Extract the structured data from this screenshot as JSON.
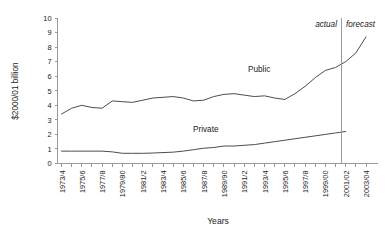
{
  "chart_data": {
    "type": "line",
    "title": "",
    "xlabel": "Years",
    "ylabel": "$2000/01 billion",
    "ylim": [
      0,
      10
    ],
    "ytick_labels": [
      "0",
      "1",
      "2",
      "3",
      "4",
      "5",
      "6",
      "7",
      "8",
      "9",
      "10"
    ],
    "grid": false,
    "legend": "inline-labels",
    "x": [
      "1973/4",
      "1974/5",
      "1975/6",
      "1976/7",
      "1977/8",
      "1978/9",
      "1979/80",
      "1980/1",
      "1981/2",
      "1982/3",
      "1983/4",
      "1984/5",
      "1985/6",
      "1986/7",
      "1987/8",
      "1988/9",
      "1989/90",
      "1990/1",
      "1991/2",
      "1992/3",
      "1993/4",
      "1994/5",
      "1995/6",
      "1996/7",
      "1997/8",
      "1998/9",
      "1999/00",
      "2000/01",
      "2001/02",
      "2002/03",
      "2003/04"
    ],
    "xtick_labels_shown": [
      "1973/4",
      "1975/6",
      "1977/8",
      "1979/80",
      "1981/2",
      "1983/4",
      "1985/6",
      "1987/8",
      "1988/90",
      "1991/2",
      "1993/4",
      "1995/6",
      "1997/8",
      "1999/00",
      "2001/02",
      "2003/04"
    ],
    "series": [
      {
        "name": "Public",
        "values": [
          3.4,
          3.8,
          4.0,
          3.85,
          3.8,
          4.3,
          4.25,
          4.2,
          4.35,
          4.5,
          4.55,
          4.6,
          4.5,
          4.3,
          4.35,
          4.6,
          4.75,
          4.8,
          4.7,
          4.6,
          4.65,
          4.5,
          4.4,
          4.8,
          5.3,
          5.9,
          6.4,
          6.6,
          7.0,
          7.6,
          8.7
        ],
        "label_text": "Public"
      },
      {
        "name": "Private",
        "values": [
          0.85,
          0.85,
          0.85,
          0.85,
          0.85,
          0.8,
          0.7,
          0.7,
          0.7,
          0.72,
          0.75,
          0.78,
          0.85,
          0.95,
          1.05,
          1.1,
          1.2,
          1.2,
          1.25,
          1.3,
          1.4,
          1.5,
          1.6,
          1.7,
          1.8,
          1.9,
          2.0,
          2.1,
          2.2,
          null,
          null
        ],
        "label_text": "Private"
      }
    ],
    "annotations": [
      {
        "name": "actual",
        "text": "actual",
        "style": "italic"
      },
      {
        "name": "forecast",
        "text": "forecast",
        "style": "italic"
      }
    ],
    "divider": {
      "at": "2001/02",
      "label_left": "actual",
      "label_right": "forecast"
    }
  }
}
